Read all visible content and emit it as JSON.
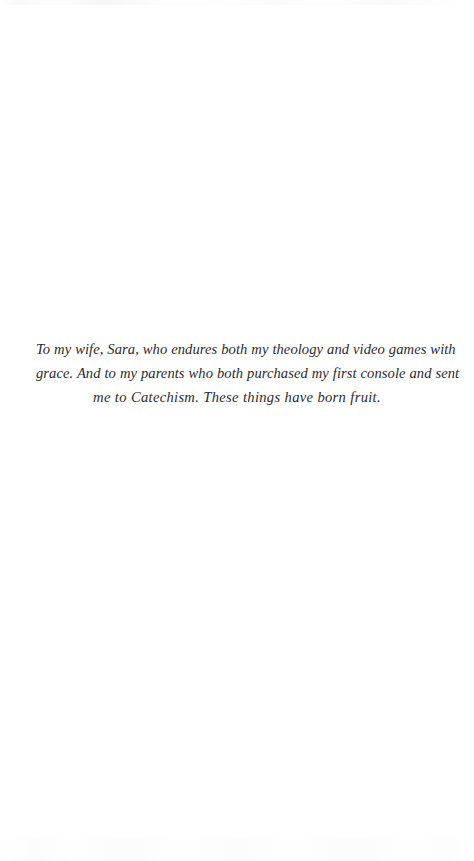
{
  "page": {
    "background_color": "#ffffff",
    "text_color": "#2b2b2e",
    "width": 474,
    "height": 861
  },
  "dedication": {
    "full_text": "To my wife, Sara, who endures both my theology and video games with grace. And to my parents who both purchased my first console and sent me to Catechism. These things have born fruit.",
    "lines": [
      "To my wife, Sara, who endures both my theology and video games with",
      "grace. And to my parents who both purchased my first console and sent",
      "me to Catechism. These things have born fruit."
    ]
  }
}
